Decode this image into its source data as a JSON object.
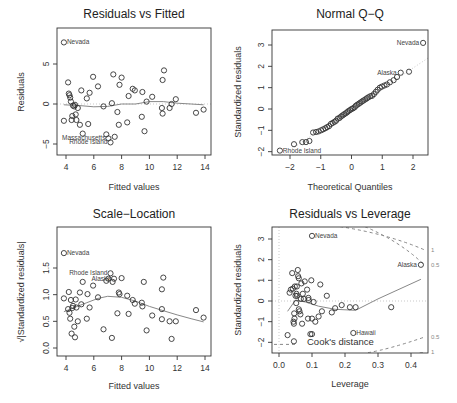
{
  "chart_data": [
    {
      "type": "scatter",
      "title": "Residuals vs Fitted",
      "xlabel": "Fitted values",
      "ylabel": "Residuals",
      "xlim": [
        3.6,
        14.2
      ],
      "ylim": [
        -6,
        8.5
      ],
      "xticks": [
        4,
        6,
        8,
        10,
        12,
        14
      ],
      "yticks": [
        -5,
        0,
        5
      ],
      "points": [
        [
          3.85,
          -2.1
        ],
        [
          4.15,
          2.7
        ],
        [
          4.2,
          1.3
        ],
        [
          4.25,
          1.1
        ],
        [
          4.3,
          0.8
        ],
        [
          4.35,
          0.3
        ],
        [
          4.4,
          -2
        ],
        [
          4.45,
          -1.5
        ],
        [
          4.5,
          -0.2
        ],
        [
          4.6,
          -0.3
        ],
        [
          4.65,
          -0.1
        ],
        [
          4.7,
          -1.3
        ],
        [
          4.75,
          -2
        ],
        [
          4.85,
          -0.5
        ],
        [
          5.0,
          -2.6
        ],
        [
          5.1,
          1.7
        ],
        [
          5.2,
          -3.7
        ],
        [
          5.5,
          0.7
        ],
        [
          5.6,
          -2.5
        ],
        [
          5.7,
          1.4
        ],
        [
          5.95,
          3.4
        ],
        [
          6.3,
          2.2
        ],
        [
          6.7,
          -0.3
        ],
        [
          6.9,
          -3.8
        ],
        [
          7.05,
          -4.3
        ],
        [
          7.2,
          -4.8
        ],
        [
          7.3,
          0.1
        ],
        [
          7.4,
          3.7
        ],
        [
          7.5,
          -4.1
        ],
        [
          7.7,
          -1
        ],
        [
          7.8,
          -2.6
        ],
        [
          7.85,
          2.4
        ],
        [
          8.0,
          3.3
        ],
        [
          8.4,
          -2.3
        ],
        [
          8.5,
          1
        ],
        [
          8.8,
          1.9
        ],
        [
          8.95,
          1.7
        ],
        [
          9.45,
          -1.6
        ],
        [
          9.5,
          1.5
        ],
        [
          9.65,
          -3.4
        ],
        [
          9.8,
          0.3
        ],
        [
          10.2,
          0.9
        ],
        [
          10.9,
          -0.5
        ],
        [
          10.95,
          -1.2
        ],
        [
          10.95,
          3
        ],
        [
          11.05,
          4.2
        ],
        [
          11.45,
          -0.5
        ],
        [
          11.6,
          0
        ],
        [
          11.9,
          0.6
        ],
        [
          13.35,
          -1.1
        ],
        [
          13.9,
          -0.7
        ],
        [
          3.85,
          7.7
        ]
      ],
      "smooth": [
        [
          3.85,
          -0.1
        ],
        [
          5,
          -0.2
        ],
        [
          6,
          -0.35
        ],
        [
          7,
          -0.3
        ],
        [
          8,
          0
        ],
        [
          9,
          0
        ],
        [
          10,
          0.3
        ],
        [
          11,
          0.3
        ],
        [
          12,
          0.1
        ],
        [
          13,
          0
        ],
        [
          13.9,
          -0.1
        ]
      ],
      "labels": [
        {
          "text": "Nevada",
          "x": 3.85,
          "y": 7.7
        },
        {
          "text": "Massachusetts",
          "x": 7.05,
          "y": -4.3
        },
        {
          "text": "Rhode Island",
          "x": 7.2,
          "y": -4.8
        }
      ]
    },
    {
      "type": "scatter",
      "title": "Normal Q-Q",
      "xlabel": "Theoretical Quantiles",
      "ylabel": "Standardized residuals",
      "xlim": [
        -2.5,
        2.5
      ],
      "ylim": [
        -2.2,
        3.6
      ],
      "xticks": [
        -2,
        -1,
        0,
        1,
        2
      ],
      "yticks": [
        -2,
        -1,
        0,
        1,
        2,
        3
      ],
      "points": [
        [
          -2.33,
          -1.95
        ],
        [
          -1.87,
          -1.65
        ],
        [
          -1.6,
          -1.55
        ],
        [
          -1.48,
          -1.55
        ],
        [
          -1.37,
          -1.5
        ],
        [
          -1.25,
          -1.1
        ],
        [
          -1.15,
          -1.08
        ],
        [
          -1.07,
          -1.05
        ],
        [
          -0.99,
          -1.0
        ],
        [
          -0.92,
          -0.95
        ],
        [
          -0.85,
          -0.9
        ],
        [
          -0.79,
          -0.85
        ],
        [
          -0.73,
          -0.8
        ],
        [
          -0.67,
          -0.7
        ],
        [
          -0.61,
          -0.65
        ],
        [
          -0.55,
          -0.6
        ],
        [
          -0.5,
          -0.55
        ],
        [
          -0.45,
          -0.45
        ],
        [
          -0.39,
          -0.42
        ],
        [
          -0.34,
          -0.35
        ],
        [
          -0.29,
          -0.3
        ],
        [
          -0.24,
          -0.25
        ],
        [
          -0.19,
          -0.2
        ],
        [
          -0.14,
          -0.15
        ],
        [
          -0.1,
          -0.1
        ],
        [
          -0.05,
          -0.05
        ],
        [
          0,
          0
        ],
        [
          0.05,
          0.03
        ],
        [
          0.1,
          0.08
        ],
        [
          0.14,
          0.15
        ],
        [
          0.19,
          0.2
        ],
        [
          0.24,
          0.25
        ],
        [
          0.29,
          0.3
        ],
        [
          0.34,
          0.35
        ],
        [
          0.39,
          0.4
        ],
        [
          0.45,
          0.45
        ],
        [
          0.5,
          0.5
        ],
        [
          0.55,
          0.55
        ],
        [
          0.61,
          0.6
        ],
        [
          0.67,
          0.62
        ],
        [
          0.73,
          0.7
        ],
        [
          0.79,
          0.8
        ],
        [
          0.85,
          0.9
        ],
        [
          0.92,
          1
        ],
        [
          0.99,
          1.05
        ],
        [
          1.07,
          1.1
        ],
        [
          1.15,
          1.15
        ],
        [
          1.25,
          1.25
        ],
        [
          1.37,
          1.35
        ],
        [
          1.48,
          1.5
        ],
        [
          1.6,
          1.7
        ],
        [
          1.87,
          1.75
        ],
        [
          2.33,
          3.1
        ]
      ],
      "refline": [
        [
          -2.5,
          -2.4
        ],
        [
          2.5,
          2.4
        ]
      ],
      "labels": [
        {
          "text": "Nevada",
          "x": 2.33,
          "y": 3.1
        },
        {
          "text": "Alaska",
          "x": 1.6,
          "y": 1.7
        },
        {
          "text": "Rhode Island",
          "x": -2.33,
          "y": -1.95
        }
      ]
    },
    {
      "type": "scatter",
      "title": "Scale-Location",
      "xlabel": "Fitted values",
      "ylabel": "√|Standardized residuals|",
      "xlim": [
        3.6,
        14.2
      ],
      "ylim": [
        -0.1,
        1.85
      ],
      "xticks": [
        4,
        6,
        8,
        10,
        12,
        14
      ],
      "yticks": [
        0.0,
        0.5,
        1.0,
        1.5
      ],
      "points": [
        [
          3.85,
          0.93
        ],
        [
          4.15,
          0.73
        ],
        [
          4.2,
          1.05
        ],
        [
          4.25,
          0.66
        ],
        [
          4.3,
          0.55
        ],
        [
          4.35,
          0.9
        ],
        [
          4.4,
          0.27
        ],
        [
          4.45,
          0.75
        ],
        [
          4.5,
          0.79
        ],
        [
          4.6,
          0.4
        ],
        [
          4.65,
          0.2
        ],
        [
          4.7,
          0.91
        ],
        [
          4.75,
          0.76
        ],
        [
          4.85,
          0.5
        ],
        [
          5.0,
          1.04
        ],
        [
          5.1,
          0.82
        ],
        [
          5.2,
          1.24
        ],
        [
          5.5,
          0.55
        ],
        [
          5.55,
          1.01
        ],
        [
          5.7,
          0.76
        ],
        [
          5.95,
          1.17
        ],
        [
          6.3,
          0.95
        ],
        [
          6.7,
          0.35
        ],
        [
          6.9,
          1.26
        ],
        [
          7.05,
          1.3
        ],
        [
          7.2,
          1.4
        ],
        [
          7.3,
          0.19
        ],
        [
          7.35,
          1.24
        ],
        [
          7.45,
          1.3
        ],
        [
          7.7,
          0.65
        ],
        [
          7.8,
          1.04
        ],
        [
          7.85,
          1.01
        ],
        [
          8.0,
          1.31
        ],
        [
          8.4,
          0.98
        ],
        [
          8.5,
          0.64
        ],
        [
          8.8,
          0.9
        ],
        [
          8.95,
          0.83
        ],
        [
          9.45,
          0.85
        ],
        [
          9.5,
          0.78
        ],
        [
          9.6,
          1.24
        ],
        [
          9.8,
          0.33
        ],
        [
          10.2,
          0.61
        ],
        [
          10.9,
          0.54
        ],
        [
          10.9,
          0.73
        ],
        [
          10.9,
          1.1
        ],
        [
          11.0,
          1.32
        ],
        [
          11.45,
          0.5
        ],
        [
          11.6,
          0.17
        ],
        [
          11.9,
          0.5
        ],
        [
          13.35,
          0.71
        ],
        [
          13.9,
          0.57
        ],
        [
          3.85,
          1.78
        ]
      ],
      "smooth": [
        [
          3.85,
          0.68
        ],
        [
          4.5,
          0.75
        ],
        [
          5.5,
          0.85
        ],
        [
          6.3,
          0.93
        ],
        [
          7,
          0.97
        ],
        [
          8,
          0.95
        ],
        [
          9,
          0.88
        ],
        [
          10,
          0.78
        ],
        [
          11,
          0.7
        ],
        [
          12,
          0.62
        ],
        [
          13,
          0.55
        ],
        [
          13.9,
          0.49
        ]
      ],
      "labels": [
        {
          "text": "Nevada",
          "x": 3.85,
          "y": 1.78
        },
        {
          "text": "Rhode Island",
          "x": 7.2,
          "y": 1.4
        },
        {
          "text": "Alaska",
          "x": 7.45,
          "y": 1.3
        }
      ]
    },
    {
      "type": "scatter",
      "title": "Residuals vs Leverage",
      "xlabel": "Leverage",
      "ylabel": "Standardized residuals",
      "xlim": [
        -0.01,
        0.445
      ],
      "ylim": [
        -2.5,
        3.6
      ],
      "xticks": [
        0.0,
        0.1,
        0.2,
        0.3,
        0.4
      ],
      "yticks": [
        -2,
        -1,
        0,
        1,
        2,
        3
      ],
      "points": [
        [
          0.026,
          -1.65
        ],
        [
          0.032,
          0.4
        ],
        [
          0.036,
          0.55
        ],
        [
          0.04,
          1.35
        ],
        [
          0.042,
          0.6
        ],
        [
          0.044,
          -1.0
        ],
        [
          0.045,
          -1.1
        ],
        [
          0.046,
          -0.6
        ],
        [
          0.047,
          -0.85
        ],
        [
          0.048,
          0.7
        ],
        [
          0.05,
          0.25
        ],
        [
          0.052,
          -0.1
        ],
        [
          0.053,
          0.35
        ],
        [
          0.054,
          0.7
        ],
        [
          0.055,
          0.25
        ],
        [
          0.057,
          1.5
        ],
        [
          0.058,
          1.2
        ],
        [
          0.06,
          1.1
        ],
        [
          0.06,
          -0.4
        ],
        [
          0.062,
          -0.5
        ],
        [
          0.065,
          -0.65
        ],
        [
          0.066,
          0.1
        ],
        [
          0.068,
          0.85
        ],
        [
          0.07,
          -1.1
        ],
        [
          0.072,
          0.35
        ],
        [
          0.075,
          0.1
        ],
        [
          0.078,
          0.95
        ],
        [
          0.085,
          0.55
        ],
        [
          0.088,
          -0.85
        ],
        [
          0.089,
          0.15
        ],
        [
          0.09,
          0.05
        ],
        [
          0.095,
          -1.6
        ],
        [
          0.098,
          1.0
        ],
        [
          0.1,
          -0.85
        ],
        [
          0.1,
          -1.6
        ],
        [
          0.105,
          -0.05
        ],
        [
          0.11,
          -1.0
        ],
        [
          0.12,
          -0.75
        ],
        [
          0.125,
          0.8
        ],
        [
          0.13,
          -0.5
        ],
        [
          0.145,
          0.25
        ],
        [
          0.16,
          -0.55
        ],
        [
          0.17,
          -0.35
        ],
        [
          0.19,
          -0.2
        ],
        [
          0.215,
          -0.3
        ],
        [
          0.232,
          -0.3
        ],
        [
          0.34,
          -0.3
        ],
        [
          0.045,
          -1.95
        ],
        [
          0.1,
          3.15
        ],
        [
          0.225,
          -1.55
        ],
        [
          0.43,
          1.75
        ]
      ],
      "smooth": [
        [
          0.026,
          -0.5
        ],
        [
          0.05,
          0.05
        ],
        [
          0.08,
          -0.05
        ],
        [
          0.12,
          -0.25
        ],
        [
          0.17,
          -0.4
        ],
        [
          0.232,
          -0.45
        ],
        [
          0.3,
          0.1
        ],
        [
          0.43,
          1.05
        ]
      ],
      "cook_contours": {
        "level_0_5": {
          "upper": [
            [
              0.26,
              3.6
            ],
            [
              0.44,
              1.75
            ]
          ],
          "lower": [
            [
              0.27,
              -2.5
            ],
            [
              0.44,
              -1.75
            ]
          ]
        },
        "level_1": {
          "upper": [
            [
              0.185,
              3.6
            ],
            [
              0.44,
              2.48
            ]
          ],
          "lower": [
            [
              0.3,
              -2.6
            ],
            [
              0.44,
              -2.48
            ]
          ]
        }
      },
      "labels": [
        {
          "text": "Nevada",
          "x": 0.1,
          "y": 3.15
        },
        {
          "text": "Alaska",
          "x": 0.43,
          "y": 1.75
        },
        {
          "text": "Hawaii",
          "x": 0.225,
          "y": -1.55
        }
      ],
      "legend": "Cook's distance",
      "contour_labels": [
        "1",
        "0.5",
        "0.5",
        "1"
      ]
    }
  ],
  "panels": {
    "p1": {
      "title": "Residuals vs Fitted",
      "xlabel": "Fitted values",
      "ylabel": "Residuals"
    },
    "p2": {
      "title": "Normal Q−Q",
      "xlabel": "Theoretical Quantiles",
      "ylabel": "Standardized residuals"
    },
    "p3": {
      "title": "Scale−Location",
      "xlabel": "Fitted values",
      "ylabel": "√|Standardized residuals|"
    },
    "p4": {
      "title": "Residuals vs Leverage",
      "xlabel": "Leverage",
      "ylabel": "Standardized residuals",
      "legend": "Cook's distance"
    }
  }
}
